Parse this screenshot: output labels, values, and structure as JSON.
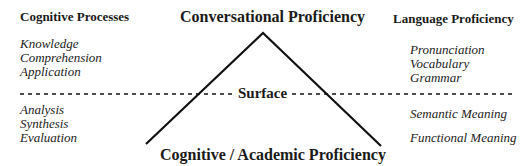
{
  "diagram": {
    "top_label": "Conversational Proficiency",
    "bottom_label": "Cognitive / Academic Proficiency",
    "surface_label": "Surface",
    "left_column": {
      "header": "Cognitive Processes",
      "above_surface": [
        "Knowledge",
        "Comprehension",
        "Application"
      ],
      "below_surface": [
        "Analysis",
        "Synthesis",
        "Evaluation"
      ]
    },
    "right_column": {
      "header": "Language Proficiency",
      "above_surface": [
        "Pronunciation",
        "Vocabulary",
        "Grammar"
      ],
      "below_surface": [
        "Semantic Meaning",
        "Functional Meaning"
      ]
    },
    "colors": {
      "line": "#111111",
      "text": "#1a1a1a",
      "background": "#ffffff"
    }
  }
}
